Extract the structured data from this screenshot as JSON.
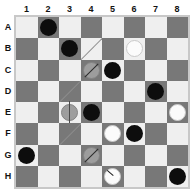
{
  "board": {
    "columns": [
      "1",
      "2",
      "3",
      "4",
      "5",
      "6",
      "7",
      "8"
    ],
    "rows": [
      "A",
      "B",
      "C",
      "D",
      "E",
      "F",
      "G",
      "H"
    ],
    "size": 8,
    "colors": {
      "light_square": "#efefef",
      "dark_square": "#787878",
      "frame": "#c8c8c8",
      "black_piece": "#0d0d0d",
      "white_piece": "#fbfbfb",
      "gray_piece": "#9d9d9d",
      "label_text": "#121212",
      "background": "#ffffff"
    },
    "first_square_shade": "light",
    "pieces": [
      {
        "row": "A",
        "col": "2",
        "color": "black",
        "marker": "none"
      },
      {
        "row": "B",
        "col": "3",
        "color": "black",
        "marker": "none"
      },
      {
        "row": "B",
        "col": "6",
        "color": "white",
        "marker": "none"
      },
      {
        "row": "C",
        "col": "4",
        "color": "gray",
        "marker": "slash"
      },
      {
        "row": "C",
        "col": "5",
        "color": "black",
        "marker": "none"
      },
      {
        "row": "D",
        "col": "7",
        "color": "black",
        "marker": "none"
      },
      {
        "row": "E",
        "col": "3",
        "color": "gray",
        "marker": "vline"
      },
      {
        "row": "E",
        "col": "4",
        "color": "black",
        "marker": "none"
      },
      {
        "row": "E",
        "col": "8",
        "color": "white",
        "marker": "none"
      },
      {
        "row": "F",
        "col": "5",
        "color": "white",
        "marker": "none"
      },
      {
        "row": "F",
        "col": "6",
        "color": "black",
        "marker": "none"
      },
      {
        "row": "G",
        "col": "1",
        "color": "black",
        "marker": "none"
      },
      {
        "row": "G",
        "col": "4",
        "color": "gray",
        "marker": "slash"
      },
      {
        "row": "H",
        "col": "5",
        "color": "white",
        "marker": "tick"
      },
      {
        "row": "H",
        "col": "8",
        "color": "black",
        "marker": "none"
      }
    ],
    "hairlines": [
      {
        "row": "B",
        "col": "4"
      },
      {
        "row": "D",
        "col": "3"
      },
      {
        "row": "F",
        "col": "3"
      }
    ]
  }
}
